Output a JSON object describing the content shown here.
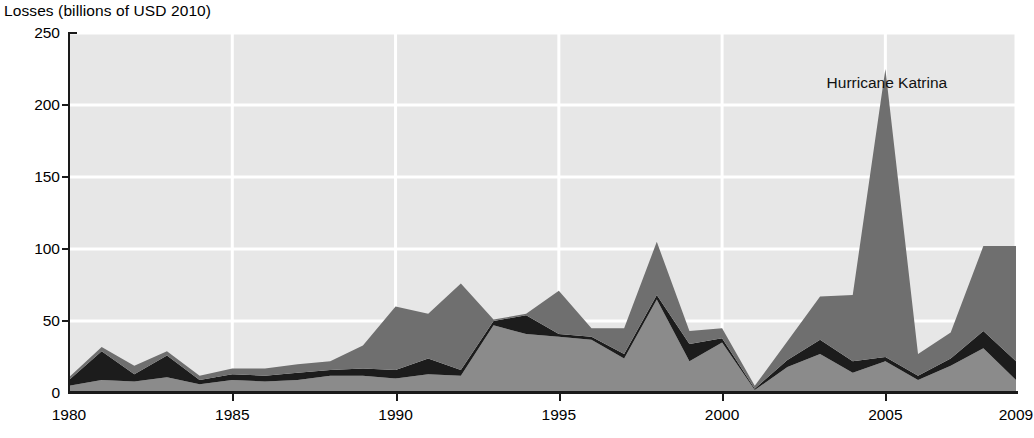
{
  "figure": {
    "axis_title": "Losses (billions of USD 2010)",
    "annotation": {
      "text": "Hurricane Katrina",
      "x_year": 2003.2,
      "y_value": 215
    }
  },
  "colors": {
    "plot_background": "#e7e7e7",
    "gridline": "#ffffff",
    "axis": "#1a1a1a",
    "series_bottom": "#8b8b8b",
    "series_middle": "#1c1c1c",
    "series_top": "#6f6f6f",
    "text": "#000000"
  },
  "chart_data": {
    "type": "area",
    "title": "Losses (billions of USD 2010)",
    "subtitle": "",
    "xlabel": "",
    "ylabel": "Losses (billions of USD 2010)",
    "xlim": [
      1980,
      2009
    ],
    "ylim": [
      0,
      250
    ],
    "grid": true,
    "legend_position": "none",
    "stacked": true,
    "x": [
      1980,
      1981,
      1982,
      1983,
      1984,
      1985,
      1986,
      1987,
      1988,
      1989,
      1990,
      1991,
      1992,
      1993,
      1994,
      1995,
      1996,
      1997,
      1998,
      1999,
      2000,
      2001,
      2002,
      2003,
      2004,
      2005,
      2006,
      2007,
      2008,
      2009
    ],
    "xticks": [
      1980,
      1985,
      1990,
      1995,
      2000,
      2005,
      2009
    ],
    "xtick_labels": [
      "1980",
      "1985",
      "1990",
      "1995",
      "2000",
      "2005",
      "2009"
    ],
    "yticks": [
      0,
      50,
      100,
      150,
      200,
      250
    ],
    "ytick_labels": [
      "0",
      "50",
      "100",
      "150",
      "200",
      "250"
    ],
    "series": [
      {
        "name": "bottom-band",
        "color": "#8b8b8b",
        "values": [
          5,
          9,
          8,
          11,
          6,
          9,
          8,
          9,
          12,
          12,
          10,
          13,
          12,
          47,
          41,
          39,
          37,
          24,
          65,
          22,
          35,
          2,
          18,
          27,
          14,
          22,
          9,
          19,
          31,
          9
        ]
      },
      {
        "name": "middle-band",
        "color": "#1c1c1c",
        "values": [
          4,
          20,
          5,
          15,
          3,
          4,
          4,
          5,
          4,
          5,
          6,
          11,
          4,
          3,
          13,
          2,
          2,
          3,
          3,
          12,
          3,
          1,
          5,
          10,
          8,
          3,
          3,
          5,
          12,
          13
        ]
      },
      {
        "name": "top-band",
        "color": "#6f6f6f",
        "values": [
          2,
          3,
          6,
          3,
          3,
          4,
          5,
          6,
          6,
          16,
          44,
          31,
          60,
          1,
          1,
          30,
          6,
          18,
          37,
          9,
          7,
          2,
          13,
          30,
          46,
          200,
          15,
          18,
          59,
          80
        ]
      }
    ],
    "totals": [
      11,
      32,
      19,
      29,
      12,
      17,
      17,
      20,
      22,
      33,
      60,
      55,
      76,
      51,
      55,
      71,
      45,
      45,
      105,
      43,
      45,
      5,
      36,
      67,
      68,
      225,
      27,
      42,
      102,
      102
    ],
    "annotations": [
      {
        "text": "Hurricane Katrina",
        "x": 2003.2,
        "y": 215
      }
    ]
  }
}
